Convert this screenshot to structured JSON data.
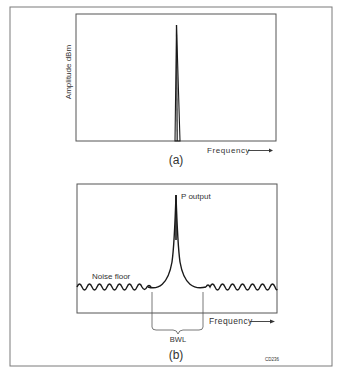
{
  "figure": {
    "code": "CD236",
    "colors": {
      "line": "#1a1a1a",
      "frame": "#6e6e6e",
      "text": "#333333",
      "background": "#ffffff"
    }
  },
  "panel_a": {
    "label": "(a)",
    "y_axis_label": "Amplitude dBm",
    "x_axis_label": "Frequency",
    "signal": "single-frequency spectral line"
  },
  "panel_b": {
    "label": "(b)",
    "x_axis_label": "Frequency",
    "peak_label": "P output",
    "noise_label": "Noise floor",
    "bandwidth_label": "BWL"
  }
}
